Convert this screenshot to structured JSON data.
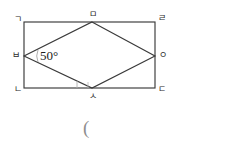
{
  "figure": {
    "kind": "rhombus-inscribed-in-rectangle",
    "stroke_color": "#3a3a3a",
    "tick_color": "#a9a9a9",
    "background": "#ffffff",
    "rectangle": {
      "left": 24,
      "top": 22,
      "right": 155,
      "bottom": 88,
      "corners": {
        "top_left": "ㄱ",
        "top_right": "ㄹ",
        "bottom_right": "ㄷ",
        "bottom_left": "ㄴ"
      }
    },
    "rhombus": {
      "top": "ㅁ",
      "right": "ㅇ",
      "bottom": "ㅅ",
      "left": "ㅂ",
      "top_x": 92,
      "bottom_x": 92,
      "side_y": 56
    },
    "angle": {
      "at_vertex": "ㅂ",
      "value": "50°"
    },
    "right_angle_marks": 2
  },
  "labels": {
    "top_left": "ㄱ",
    "top_center": "ㅁ",
    "top_right": "ㄹ",
    "middle_left": "ㅂ",
    "middle_right": "ㅇ",
    "bottom_left": "ㄴ",
    "bottom_center": "ㅅ",
    "bottom_right": "ㄷ",
    "angle": "50°"
  },
  "caption": {
    "paren": "("
  }
}
